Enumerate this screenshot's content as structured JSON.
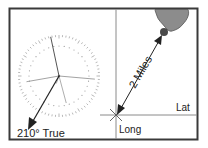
{
  "diagram": {
    "bearing_label": "210° True",
    "distance_label": "2 Miles",
    "lat_label": "Lat",
    "long_label": "Long",
    "bearing_degrees": 210,
    "colors": {
      "frame": "#3a3a3a",
      "grid": "#8a8a8a",
      "land": "#8c8c8c",
      "landmark": "#4a4a4a",
      "arrow": "#222222",
      "compass": "#9a9a9a"
    }
  }
}
